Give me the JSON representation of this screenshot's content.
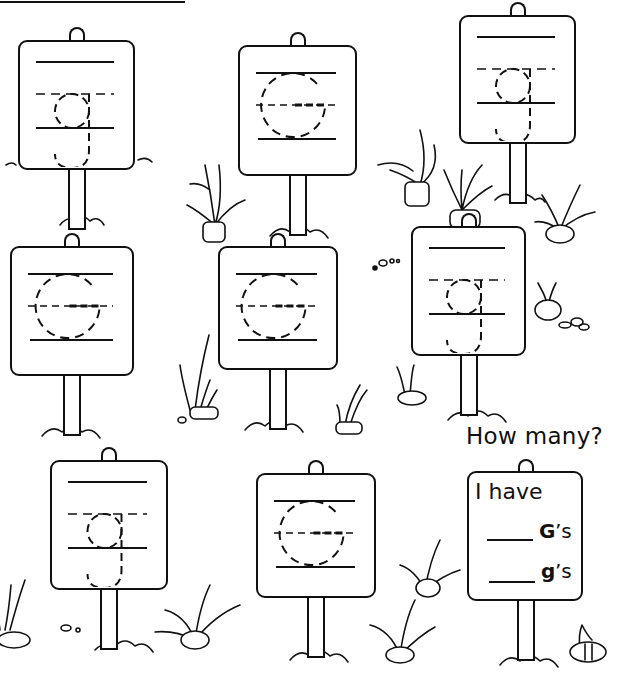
{
  "worksheet": {
    "letter_upper": "G",
    "letter_lower": "g",
    "signs": [
      {
        "id": 1,
        "letter": "g",
        "case": "lowercase",
        "box": [
          18,
          40,
          117,
          130
        ]
      },
      {
        "id": 2,
        "letter": "G",
        "case": "uppercase",
        "box": [
          238,
          45,
          119,
          131
        ]
      },
      {
        "id": 3,
        "letter": "g",
        "case": "lowercase",
        "box": [
          459,
          15,
          117,
          129
        ]
      },
      {
        "id": 4,
        "letter": "G",
        "case": "uppercase",
        "box": [
          10,
          246,
          124,
          130
        ]
      },
      {
        "id": 5,
        "letter": "G",
        "case": "uppercase",
        "box": [
          218,
          246,
          120,
          124
        ]
      },
      {
        "id": 6,
        "letter": "g",
        "case": "lowercase",
        "box": [
          411,
          226,
          115,
          130
        ]
      },
      {
        "id": 7,
        "letter": "g",
        "case": "lowercase",
        "box": [
          50,
          460,
          118,
          130
        ]
      },
      {
        "id": 8,
        "letter": "G",
        "case": "uppercase",
        "box": [
          256,
          473,
          120,
          125
        ]
      }
    ],
    "counts": {
      "uppercase_signs": 4,
      "lowercase_signs": 4
    }
  },
  "question": {
    "title": "How many?",
    "intro": "I have",
    "line1_blank": "____",
    "line1_letter": "G",
    "line1_suffix": "’s",
    "line2_blank": "____",
    "line2_letter": "g",
    "line2_suffix": "’s"
  },
  "colors": {
    "ink": "#111111",
    "paper": "#ffffff"
  }
}
